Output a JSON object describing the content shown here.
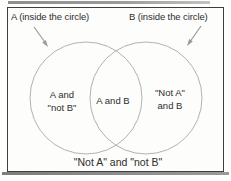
{
  "figure": {
    "type": "venn-diagram",
    "colors": {
      "frame_border": "#3e3e3e",
      "circle_stroke": "#b2b2b2",
      "arrow": "#9a9a9a",
      "text": "#2d2d2d",
      "paper": "#fdfdfc",
      "scan_rule": "#909090"
    },
    "callouts": {
      "a": "A (inside the circle)",
      "b": "B (inside the circle)"
    },
    "regions": {
      "a_only_line1": "A and",
      "a_only_line2": "\"not B\"",
      "intersection": "A and B",
      "b_only_line1": "\"Not A\"",
      "b_only_line2": "and B",
      "outside": "\"Not A\" and \"not B\""
    }
  }
}
